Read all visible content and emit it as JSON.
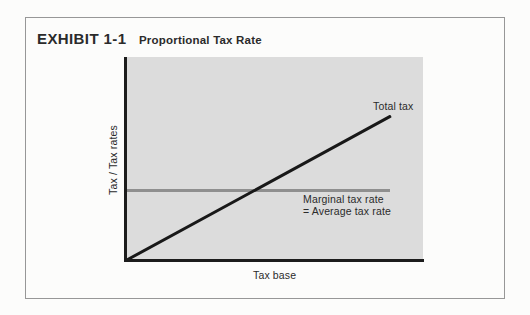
{
  "exhibit": {
    "label": "EXHIBIT 1-1",
    "title": "Proportional Tax Rate"
  },
  "labels": {
    "total_tax": "Total tax",
    "marginal_line1": "Marginal tax rate",
    "marginal_line2": "= Average tax rate",
    "y_axis": "Tax / Tax rates",
    "x_axis": "Tax base"
  },
  "colors": {
    "page_bg": "#fcfcfb",
    "frame_border": "#979797",
    "plot_bg": "#dcdcdc",
    "axis": "#1c1c1c",
    "total_tax_line": "#181818",
    "marginal_line": "#8f8f8f",
    "text": "#2b2b2b"
  },
  "chart_data": {
    "type": "line",
    "title": "Proportional Tax Rate",
    "xlabel": "Tax base",
    "ylabel": "Tax / Tax rates",
    "axis_ticks": "none",
    "grid": false,
    "x_range_normalized": [
      0,
      1
    ],
    "y_range_normalized": [
      0,
      1
    ],
    "series": [
      {
        "name": "Total tax",
        "color": "#181818",
        "style": "solid-thick",
        "x": [
          0,
          0.89
        ],
        "y": [
          0,
          0.71
        ],
        "description": "Straight line from the origin with constant positive slope"
      },
      {
        "name": "Marginal tax rate = Average tax rate",
        "color": "#8f8f8f",
        "style": "solid-thick",
        "x": [
          0,
          0.89
        ],
        "y": [
          0.35,
          0.35
        ],
        "description": "Horizontal line: tax rate is constant as tax base grows"
      }
    ],
    "annotations": [
      {
        "text": "Total tax",
        "anchor_series": "Total tax",
        "position": "above line end"
      },
      {
        "text": "Marginal tax rate\n= Average tax rate",
        "anchor_series": "Marginal tax rate = Average tax rate",
        "position": "below line, right side"
      }
    ],
    "legend": "none"
  }
}
